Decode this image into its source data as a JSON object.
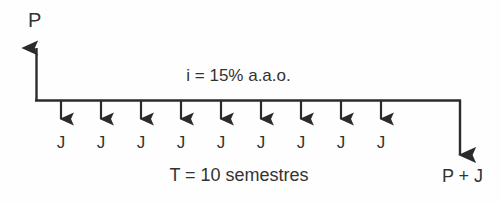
{
  "diagram": {
    "type": "cash-flow-timeline",
    "title_label": "P",
    "rate_label": "i = 15% a.a.o.",
    "term_label": "T = 10 semestres",
    "final_label": "P + J",
    "installment_label": "J",
    "installments": [
      {
        "index": 1,
        "label": "J",
        "x": 61
      },
      {
        "index": 2,
        "label": "J",
        "x": 101
      },
      {
        "index": 3,
        "label": "J",
        "x": 141
      },
      {
        "index": 4,
        "label": "J",
        "x": 181
      },
      {
        "index": 5,
        "label": "J",
        "x": 221
      },
      {
        "index": 6,
        "label": "J",
        "x": 261
      },
      {
        "index": 7,
        "label": "J",
        "x": 301
      },
      {
        "index": 8,
        "label": "J",
        "x": 341
      },
      {
        "index": 9,
        "label": "J",
        "x": 381
      }
    ],
    "geometry": {
      "baseline_y": 101,
      "axis_left_x": 36,
      "axis_right_x": 460,
      "up_arrow_tip_y": 41,
      "down_arrow_tip_y": 126,
      "final_arrow_tip_y": 163
    },
    "colors": {
      "stroke": "#2b2b2b",
      "text": "#333333",
      "background": "#fefefe"
    }
  }
}
